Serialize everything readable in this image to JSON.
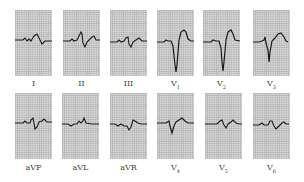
{
  "figure": {
    "type": "12-lead ECG",
    "trace_color": "#1a1a1a",
    "grid_color": "#b8b8b8",
    "paper_color": "#d8d8d8"
  },
  "rows": [
    {
      "leads": [
        {
          "name": "I",
          "label": "I",
          "sub": ""
        },
        {
          "name": "II",
          "label": "II",
          "sub": ""
        },
        {
          "name": "III",
          "label": "III",
          "sub": ""
        },
        {
          "name": "V1",
          "label": "V",
          "sub": "1"
        },
        {
          "name": "V2",
          "label": "V",
          "sub": "2"
        },
        {
          "name": "V3",
          "label": "V",
          "sub": "3"
        }
      ]
    },
    {
      "leads": [
        {
          "name": "aVF",
          "label": "aVF",
          "sub": ""
        },
        {
          "name": "aVL",
          "label": "aVL",
          "sub": ""
        },
        {
          "name": "aVR",
          "label": "aVR",
          "sub": ""
        },
        {
          "name": "V4",
          "label": "V",
          "sub": "4"
        },
        {
          "name": "V5",
          "label": "V",
          "sub": "5"
        },
        {
          "name": "V6",
          "label": "V",
          "sub": "6"
        }
      ]
    }
  ]
}
